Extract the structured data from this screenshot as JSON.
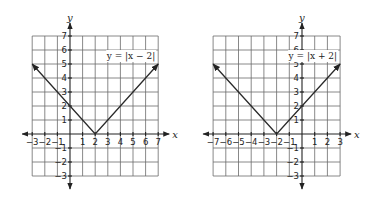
{
  "chart_data": [
    {
      "type": "line",
      "title": "y = |x − 2|",
      "equation_label": "y = |x − 2|",
      "xlabel": "x",
      "ylabel": "y",
      "xlim": [
        -3,
        7
      ],
      "ylim": [
        -3,
        7
      ],
      "x_ticks": [
        "−3",
        "−2",
        "−1",
        "1",
        "2",
        "3",
        "4",
        "5",
        "6",
        "7"
      ],
      "y_ticks": [
        "7",
        "6",
        "5",
        "4",
        "3",
        "2",
        "1",
        "−1",
        "−2",
        "−3"
      ],
      "grid": true,
      "series": [
        {
          "name": "y = |x − 2|",
          "x": [
            -3,
            2,
            7
          ],
          "y": [
            5,
            0,
            5
          ],
          "vertex": [
            2,
            0
          ]
        }
      ]
    },
    {
      "type": "line",
      "title": "y = |x + 2|",
      "equation_label": "y = |x + 2|",
      "xlabel": "x",
      "ylabel": "y",
      "xlim": [
        -7,
        3
      ],
      "ylim": [
        -3,
        7
      ],
      "x_ticks": [
        "−7",
        "−6",
        "−5",
        "−4",
        "−3",
        "−2",
        "−1",
        "1",
        "2",
        "3"
      ],
      "y_ticks": [
        "7",
        "6",
        "5",
        "4",
        "3",
        "2",
        "1",
        "−1",
        "−2",
        "−3"
      ],
      "grid": true,
      "series": [
        {
          "name": "y = |x + 2|",
          "x": [
            -7,
            -2,
            3
          ],
          "y": [
            5,
            0,
            5
          ],
          "vertex": [
            -2,
            0
          ]
        }
      ]
    }
  ],
  "graphs": {
    "left": {
      "equation": "y = |x − 2|",
      "x_axis_label": "x",
      "y_axis_label": "y"
    },
    "right": {
      "equation": "y = |x + 2|",
      "x_axis_label": "x",
      "y_axis_label": "y"
    }
  }
}
